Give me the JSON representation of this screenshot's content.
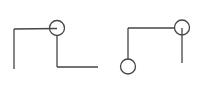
{
  "canvas": {
    "width": 203,
    "height": 87,
    "background": "#ffffff",
    "stroke_color": "#454545",
    "stroke_width": 1.3
  },
  "figures": [
    {
      "name": "left-figure",
      "description": "open rectangle path with circle node at top joint",
      "segments": [
        {
          "name": "top-horizontal-line",
          "x1": 14,
          "y1": 29,
          "x2": 57,
          "y2": 28.5
        },
        {
          "name": "left-vertical-line",
          "x1": 14,
          "y1": 29,
          "x2": 14,
          "y2": 69
        },
        {
          "name": "middle-vertical-line",
          "x1": 57,
          "y1": 35.5,
          "x2": 57,
          "y2": 67
        },
        {
          "name": "bottom-horizontal-line",
          "x1": 57,
          "y1": 67,
          "x2": 98,
          "y2": 67
        }
      ],
      "circles": [
        {
          "name": "top-joint-node",
          "cx": 57,
          "cy": 28,
          "r": 7.5
        }
      ]
    },
    {
      "name": "right-figure",
      "description": "corner path with circle node at top-right and circle terminal at bottom-left",
      "segments": [
        {
          "name": "top-horizontal-line",
          "x1": 128,
          "y1": 28,
          "x2": 174.5,
          "y2": 28
        },
        {
          "name": "left-vertical-line",
          "x1": 128,
          "y1": 28,
          "x2": 128,
          "y2": 59
        },
        {
          "name": "right-vertical-line",
          "x1": 182,
          "y1": 28,
          "x2": 182,
          "y2": 63
        }
      ],
      "circles": [
        {
          "name": "top-right-node",
          "cx": 182,
          "cy": 27.5,
          "r": 7.5
        },
        {
          "name": "bottom-left-node",
          "cx": 128,
          "cy": 66.5,
          "r": 7.5
        }
      ]
    }
  ]
}
